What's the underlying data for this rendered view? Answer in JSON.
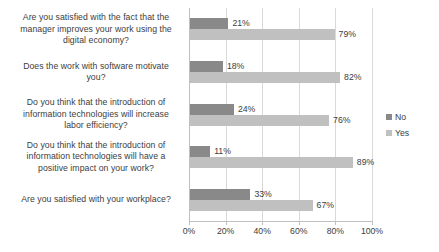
{
  "chart_data": {
    "type": "bar",
    "orientation": "horizontal",
    "title": "",
    "xlabel": "",
    "ylabel": "",
    "xlim": [
      0,
      100
    ],
    "xticks": [
      "0%",
      "20%",
      "40%",
      "60%",
      "80%",
      "100%"
    ],
    "xtick_values": [
      0,
      20,
      40,
      60,
      80,
      100
    ],
    "grid": true,
    "legend_position": "right",
    "categories": [
      "Are you satisfied with the fact that the manager improves your work using the digital economy?",
      "Does the work with software motivate you?",
      "Do you think that the introduction of information technologies will increase labor efficiency?",
      "Do you think that the introduction of information technologies will have a positive impact on your work?",
      "Are you satisfied with your workplace?"
    ],
    "category_lines": [
      [
        "Are you satisfied with the fact that the",
        "manager improves your work using the",
        "digital economy?"
      ],
      [
        "Does the work with software motivate",
        "you?"
      ],
      [
        "Do you think that the introduction of",
        "information technologies will increase",
        "labor efficiency?"
      ],
      [
        "Do you think that the introduction of",
        "information technologies will have a",
        "positive impact on your work?"
      ],
      [
        "Are you satisfied with your workplace?"
      ]
    ],
    "series": [
      {
        "name": "No",
        "color": "#898989",
        "values": [
          21,
          18,
          24,
          11,
          33
        ],
        "labels": [
          "21%",
          "18%",
          "24%",
          "11%",
          "33%"
        ]
      },
      {
        "name": "Yes",
        "color": "#c0c0c0",
        "values": [
          79,
          82,
          76,
          89,
          67
        ],
        "labels": [
          "79%",
          "82%",
          "76%",
          "89%",
          "67%"
        ]
      }
    ]
  },
  "legend": {
    "items": [
      {
        "label": "No",
        "color": "#898989"
      },
      {
        "label": "Yes",
        "color": "#c0c0c0"
      }
    ]
  }
}
